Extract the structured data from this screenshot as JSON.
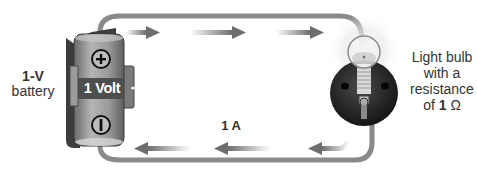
{
  "battery": {
    "label_value": "1-V",
    "label_name": "battery",
    "body_text": "1 Volt",
    "positive_symbol": "plus-icon",
    "negative_symbol": "minus-icon"
  },
  "current": {
    "label": "1 A",
    "direction": "clockwise",
    "top_arrows": 3,
    "bottom_arrows": 3
  },
  "bulb": {
    "line1": "Light bulb",
    "line2": "with a",
    "line3": "resistance",
    "line4_prefix": "of ",
    "line4_value": "1",
    "line4_unit": " Ω"
  },
  "colors": {
    "wire": "#8a8a8a",
    "arrow": "#6e6e6e",
    "battery_body": "#8c8c8c",
    "battery_band": "#555555",
    "socket": "#2a2a2a",
    "text": "#333333"
  }
}
